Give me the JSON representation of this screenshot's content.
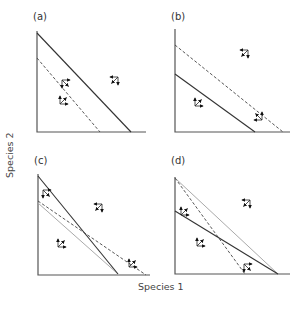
{
  "figure": {
    "axis_labels": {
      "x": "Species 1",
      "y": "Species 2"
    },
    "panels": [
      {
        "id": "a",
        "label": "(a)",
        "isoclines": [
          {
            "name": "species-1-isocline",
            "style": "solid",
            "from": "y-axis high",
            "to": "x-axis far"
          },
          {
            "name": "species-2-isocline",
            "style": "dashed",
            "from": "y-axis low",
            "to": "x-axis near"
          }
        ],
        "outcome": "species 1 wins"
      },
      {
        "id": "b",
        "label": "(b)",
        "isoclines": [
          {
            "name": "species-2-isocline",
            "style": "dashed",
            "from": "y-axis high",
            "to": "x-axis far"
          },
          {
            "name": "species-1-isocline",
            "style": "solid",
            "from": "y-axis low",
            "to": "x-axis near"
          }
        ],
        "outcome": "species 2 wins"
      },
      {
        "id": "c",
        "label": "(c)",
        "isoclines": [
          {
            "name": "species-1-isocline",
            "style": "solid"
          },
          {
            "name": "species-2-isocline",
            "style": "dashed"
          },
          {
            "name": "reference-line",
            "style": "gray"
          }
        ],
        "outcome": "stable coexistence"
      },
      {
        "id": "d",
        "label": "(d)",
        "isoclines": [
          {
            "name": "reference-line",
            "style": "gray"
          },
          {
            "name": "species-2-isocline",
            "style": "dashed"
          },
          {
            "name": "species-1-isocline",
            "style": "solid"
          }
        ],
        "outcome": "unstable equilibrium"
      }
    ]
  }
}
